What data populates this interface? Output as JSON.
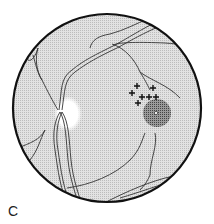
{
  "figure": {
    "panel_label": "C",
    "colors": {
      "background": "#ffffff",
      "fundus_fill": "#d6d6d6",
      "border": "#111111",
      "vessel": "#333333",
      "optic_disc": "#ffffff",
      "macula": "#555555"
    },
    "elements": {
      "optic_disc": "optic-disc",
      "macula_lesion": "macular-lesion",
      "crosses_count": 7
    }
  }
}
